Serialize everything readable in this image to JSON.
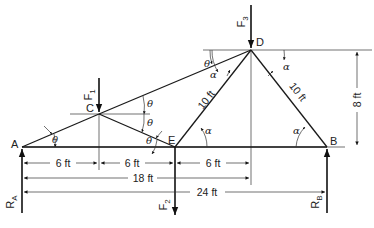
{
  "diagram": {
    "type": "truss",
    "nodes": [
      {
        "id": "A",
        "label": "A",
        "x": 22,
        "y": 147
      },
      {
        "id": "C",
        "label": "C",
        "x": 99,
        "y": 114
      },
      {
        "id": "E",
        "label": "E",
        "x": 175,
        "y": 147
      },
      {
        "id": "D",
        "label": "D",
        "x": 251,
        "y": 50
      },
      {
        "id": "B",
        "label": "B",
        "x": 327,
        "y": 147
      }
    ],
    "members": [
      {
        "from": "A",
        "to": "C"
      },
      {
        "from": "C",
        "to": "D"
      },
      {
        "from": "C",
        "to": "E"
      },
      {
        "from": "A",
        "to": "E"
      },
      {
        "from": "E",
        "to": "D",
        "label": "10 ft"
      },
      {
        "from": "E",
        "to": "B"
      },
      {
        "from": "D",
        "to": "B",
        "label": "10 ft"
      }
    ],
    "forces": {
      "F1": {
        "label": "F",
        "sub": "1",
        "at": "C",
        "direction": "down"
      },
      "F2": {
        "label": "F",
        "sub": "2",
        "at": "E",
        "direction": "down"
      },
      "F3": {
        "label": "F",
        "sub": "3",
        "at": "D",
        "direction": "down"
      },
      "RA": {
        "label": "R",
        "sub": "A",
        "at": "A",
        "direction": "up"
      },
      "RB": {
        "label": "R",
        "sub": "B",
        "at": "B",
        "direction": "up"
      }
    },
    "dimensions": {
      "ac_horizontal": "6 ft",
      "ce_horizontal": "6 ft",
      "ed_horizontal": "6 ft",
      "ad_horizontal": "18 ft",
      "ab_horizontal": "24 ft",
      "height": "8 ft",
      "ed_length": "10 ft",
      "db_length": "10 ft"
    },
    "angles": {
      "theta": "θ",
      "alpha": "α"
    }
  }
}
